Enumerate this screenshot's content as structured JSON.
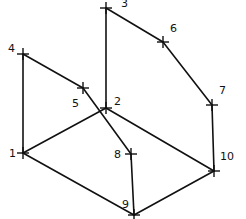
{
  "diagram": {
    "type": "wireframe-graph",
    "stroke_color": "#111111",
    "background": "#ffffff",
    "nodes": [
      {
        "id": "1",
        "label": "1",
        "x": 23,
        "y": 153,
        "lx": 9,
        "ly": 157
      },
      {
        "id": "2",
        "label": "2",
        "x": 106,
        "y": 108,
        "lx": 114,
        "ly": 105
      },
      {
        "id": "3",
        "label": "3",
        "x": 106,
        "y": 8,
        "lx": 121,
        "ly": 7
      },
      {
        "id": "4",
        "label": "4",
        "x": 23,
        "y": 54,
        "lx": 8,
        "ly": 52
      },
      {
        "id": "5",
        "label": "5",
        "x": 83,
        "y": 88,
        "lx": 72,
        "ly": 107
      },
      {
        "id": "6",
        "label": "6",
        "x": 163,
        "y": 42,
        "lx": 170,
        "ly": 32
      },
      {
        "id": "7",
        "label": "7",
        "x": 212,
        "y": 105,
        "lx": 219,
        "ly": 94
      },
      {
        "id": "8",
        "label": "8",
        "x": 131,
        "y": 154,
        "lx": 114,
        "ly": 158
      },
      {
        "id": "9",
        "label": "9",
        "x": 134,
        "y": 215,
        "lx": 122,
        "ly": 208
      },
      {
        "id": "10",
        "label": "10",
        "x": 214,
        "y": 171,
        "lx": 220,
        "ly": 160
      }
    ],
    "edges": [
      [
        "1",
        "4"
      ],
      [
        "4",
        "5"
      ],
      [
        "5",
        "8"
      ],
      [
        "2",
        "3"
      ],
      [
        "3",
        "6"
      ],
      [
        "6",
        "7"
      ],
      [
        "7",
        "10"
      ],
      [
        "2",
        "10"
      ],
      [
        "1",
        "2"
      ],
      [
        "1",
        "9"
      ],
      [
        "8",
        "9"
      ],
      [
        "9",
        "10"
      ]
    ]
  }
}
